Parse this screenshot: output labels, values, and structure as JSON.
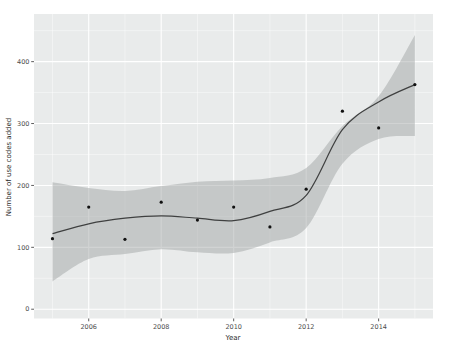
{
  "figure": {
    "background": "#ffffff",
    "panel_background": "#e9ebeb",
    "grid_color": "#ffffff",
    "ribbon_color": "#9a9d9d",
    "ribbon_opacity": 0.45,
    "line_color": "#3f4040",
    "point_color": "#111111",
    "tick_mark_color": "#333333",
    "axis_text_color": "#4d4d4d"
  },
  "chart_data": {
    "type": "scatter",
    "subtype": "scatter-with-loess-smooth-and-confidence-ribbon",
    "title": "",
    "xlabel": "Year",
    "ylabel": "Number of use codes added",
    "x": [
      2005,
      2006,
      2007,
      2008,
      2009,
      2010,
      2011,
      2012,
      2013,
      2014,
      2015
    ],
    "series": [
      {
        "name": "points",
        "values": [
          114,
          165,
          113,
          173,
          144,
          165,
          133,
          194,
          320,
          293,
          363
        ]
      },
      {
        "name": "smooth_line",
        "values": [
          122,
          138,
          147,
          151,
          147,
          143,
          158,
          184,
          290,
          335,
          363
        ]
      },
      {
        "name": "ci_upper",
        "values": [
          205,
          196,
          191,
          199,
          206,
          208,
          212,
          228,
          296,
          344,
          443
        ]
      },
      {
        "name": "ci_lower",
        "values": [
          45,
          81,
          89,
          97,
          92,
          91,
          108,
          131,
          235,
          275,
          280
        ]
      }
    ],
    "x_ticks": [
      2006,
      2008,
      2010,
      2012,
      2014
    ],
    "y_ticks": [
      0,
      100,
      200,
      300,
      400
    ],
    "x_minor_ticks": [
      2005,
      2007,
      2009,
      2011,
      2013,
      2015
    ],
    "y_minor_ticks": [
      50,
      150,
      250,
      350,
      450
    ],
    "xlim": [
      2004.49,
      2015.5
    ],
    "ylim": [
      -15,
      477
    ],
    "grid": true,
    "legend": "none"
  }
}
